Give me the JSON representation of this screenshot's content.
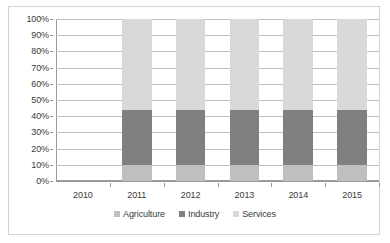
{
  "chart_data": {
    "type": "bar",
    "subtype": "100% stacked column",
    "title": "",
    "xlabel": "",
    "ylabel": "",
    "categories": [
      "2010",
      "2011",
      "2012",
      "2013",
      "2014",
      "2015"
    ],
    "series": [
      {
        "name": "Agriculture",
        "color": "#bfbfbf",
        "values": [
          null,
          10,
          10,
          10,
          10,
          10
        ]
      },
      {
        "name": "Industry",
        "color": "#808080",
        "values": [
          null,
          34,
          34,
          34,
          34,
          34
        ]
      },
      {
        "name": "Services",
        "color": "#d9d9d9",
        "values": [
          null,
          56,
          56,
          56,
          56,
          56
        ]
      }
    ],
    "ylim": [
      0,
      100
    ],
    "ytick_labels": [
      "0%",
      "10%",
      "20%",
      "30%",
      "40%",
      "50%",
      "60%",
      "70%",
      "80%",
      "90%",
      "100%"
    ],
    "ytick_values": [
      0,
      10,
      20,
      30,
      40,
      50,
      60,
      70,
      80,
      90,
      100
    ],
    "grid": true,
    "legend_position": "bottom",
    "legend_entries": [
      "Agriculture",
      "Industry",
      "Services"
    ]
  },
  "colors": {
    "agriculture": "#bfbfbf",
    "industry": "#808080",
    "services": "#d9d9d9",
    "gridline": "#bfbfbf",
    "axis": "#9a9a9a",
    "frame_border": "#d3d3d3",
    "text": "#3a3a3a",
    "background": "#ffffff"
  }
}
